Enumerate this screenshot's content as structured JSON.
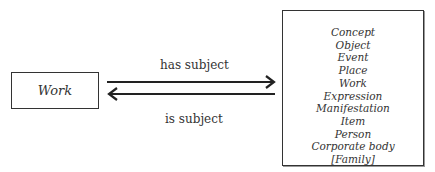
{
  "diagram": {
    "source_entity": "Work",
    "relationships": [
      {
        "label": "has subject",
        "direction": "right"
      },
      {
        "label": "is subject",
        "direction": "left"
      }
    ],
    "target_entities": [
      "Concept",
      "Object",
      "Event",
      "Place",
      "Work",
      "Expression",
      "Manifestation",
      "Item",
      "Person",
      "Corporate body",
      "[Family]"
    ]
  }
}
